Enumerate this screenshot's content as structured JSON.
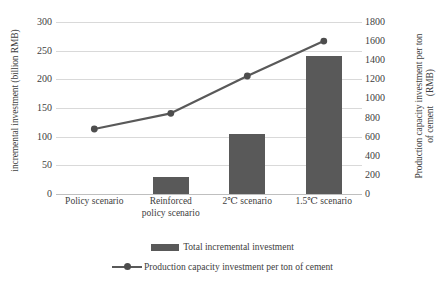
{
  "chart_data": {
    "type": "bar",
    "title": "",
    "categories": [
      "Policy scenario",
      "Reinforced\npolicy scenario",
      "2℃ scenario",
      "1.5℃ scenario"
    ],
    "series": [
      {
        "name": "Total incremental investment",
        "type": "bar",
        "axis": "left",
        "values": [
          0,
          30,
          105,
          240
        ],
        "color": "#595959"
      },
      {
        "name": "Production capacity investment per ton of cement",
        "type": "line",
        "axis": "right",
        "values": [
          680,
          845,
          1235,
          1600
        ],
        "color": "#595959"
      }
    ],
    "xlabel": "",
    "ylabel": "incremental investment (billion RMB)",
    "y2label_line1": "Production capacity investment per ton",
    "y2label_line2": "of cement　(RMB)",
    "ylim": [
      0,
      300
    ],
    "y2lim": [
      0,
      1800
    ],
    "yticks": [
      "0",
      "50",
      "100",
      "150",
      "200",
      "250",
      "300"
    ],
    "ytick_values": [
      0,
      50,
      100,
      150,
      200,
      250,
      300
    ],
    "y2ticks": [
      "0",
      "200",
      "400",
      "600",
      "800",
      "1000",
      "1200",
      "1400",
      "1600",
      "1800"
    ],
    "y2tick_values": [
      0,
      200,
      400,
      600,
      800,
      1000,
      1200,
      1400,
      1600,
      1800
    ],
    "grid": true,
    "legend_position": "bottom",
    "legend": [
      {
        "label": "Total incremental investment",
        "marker": "bar-swatch"
      },
      {
        "label": "Production capacity investment per ton of cement",
        "marker": "line-marker-swatch"
      }
    ]
  },
  "colors": {
    "bar": "#595959",
    "line": "#595959",
    "marker": "#4d4d4d",
    "grid": "#d9d9d9",
    "axis": "#bfbfbf",
    "text": "#404040",
    "background": "#ffffff"
  }
}
